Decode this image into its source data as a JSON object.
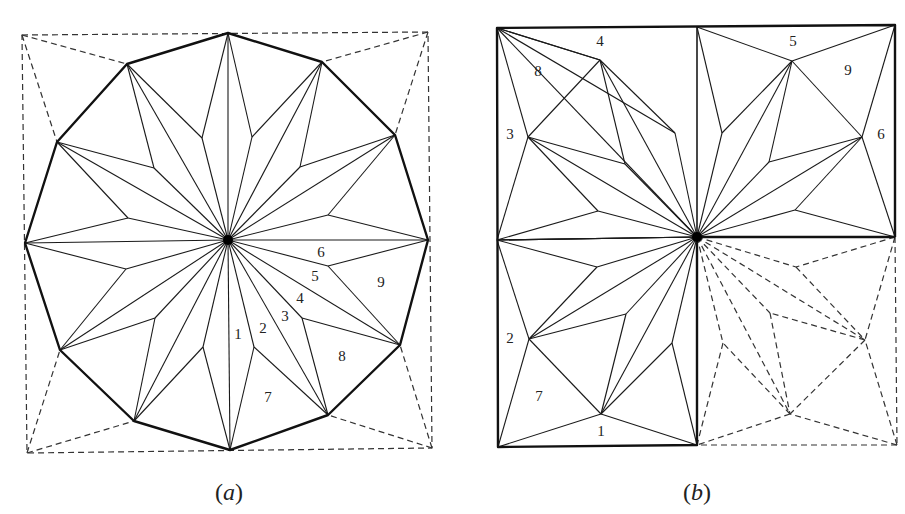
{
  "figures": [
    {
      "id": "a",
      "caption": "(a)",
      "caption_pos": [
        229,
        500
      ],
      "center": [
        228,
        240
      ],
      "dashed_square": [
        [
          22,
          35
        ],
        [
          428,
          32
        ],
        [
          432,
          448
        ],
        [
          27,
          453
        ]
      ],
      "outer_vertices": [
        [
          228,
          33
        ],
        [
          322,
          62
        ],
        [
          395,
          135
        ],
        [
          428,
          240
        ],
        [
          400,
          345
        ],
        [
          328,
          415
        ],
        [
          230,
          450
        ],
        [
          134,
          421
        ],
        [
          60,
          350
        ],
        [
          25,
          243
        ],
        [
          57,
          142
        ],
        [
          127,
          64
        ]
      ],
      "inner_points": [
        [
          252,
          137
        ],
        [
          300,
          167
        ],
        [
          328,
          215
        ],
        [
          328,
          266
        ],
        [
          302,
          318
        ],
        [
          254,
          347
        ],
        [
          203,
          347
        ],
        [
          155,
          318
        ],
        [
          126,
          269
        ],
        [
          128,
          218
        ],
        [
          154,
          168
        ],
        [
          202,
          138
        ]
      ],
      "labels": [
        {
          "text": "1",
          "x": 238,
          "y": 336
        },
        {
          "text": "2",
          "x": 263,
          "y": 330
        },
        {
          "text": "3",
          "x": 285,
          "y": 318
        },
        {
          "text": "4",
          "x": 300,
          "y": 300
        },
        {
          "text": "5",
          "x": 315,
          "y": 278
        },
        {
          "text": "6",
          "x": 321,
          "y": 254
        },
        {
          "text": "7",
          "x": 268,
          "y": 399
        },
        {
          "text": "8",
          "x": 342,
          "y": 358
        },
        {
          "text": "9",
          "x": 381,
          "y": 284
        }
      ]
    },
    {
      "id": "b",
      "caption": "(b)",
      "caption_pos": [
        697,
        500
      ],
      "center": [
        697,
        237
      ],
      "outer_rect": [
        [
          497,
          28
        ],
        [
          895,
          25
        ],
        [
          897,
          445
        ],
        [
          498,
          447
        ]
      ],
      "quadrants": [
        {
          "name": "top-left",
          "style": "solid",
          "corners": [
            [
              497,
              28
            ],
            [
              697,
              27
            ],
            [
              497,
              240
            ]
          ],
          "corner_far": [
            497,
            28
          ],
          "vertices": [
            [
              600,
              60
            ],
            [
              528,
              137
            ]
          ],
          "inner_points": [
            [
              675,
              133
            ],
            [
              625,
              164
            ],
            [
              598,
              211
            ]
          ]
        },
        {
          "name": "top-right",
          "style": "solid",
          "corners": [
            [
              697,
              27
            ],
            [
              895,
              25
            ],
            [
              895,
              237
            ]
          ],
          "corner_far": [
            895,
            25
          ],
          "vertices": [
            [
              792,
              61
            ],
            [
              862,
              137
            ]
          ],
          "inner_points": [
            [
              722,
              133
            ],
            [
              769,
              162
            ],
            [
              795,
              210
            ]
          ]
        },
        {
          "name": "bottom-left",
          "style": "solid",
          "corners": [
            [
              497,
              240
            ],
            [
              498,
              447
            ],
            [
              697,
              445
            ]
          ],
          "corner_far": [
            498,
            447
          ],
          "vertices": [
            [
              529,
              339
            ],
            [
              601,
              414
            ]
          ],
          "inner_points": [
            [
              597,
              267
            ],
            [
              626,
              314
            ],
            [
              672,
              343
            ]
          ]
        },
        {
          "name": "bottom-right",
          "style": "dashed",
          "corners": [
            [
              895,
              237
            ],
            [
              897,
              445
            ],
            [
              697,
              445
            ]
          ],
          "corner_far": [
            897,
            445
          ],
          "vertices": [
            [
              865,
              340
            ],
            [
              790,
              414
            ]
          ],
          "inner_points": [
            [
              796,
              267
            ],
            [
              770,
              313
            ],
            [
              723,
              343
            ]
          ]
        }
      ],
      "labels": [
        {
          "text": "4",
          "x": 600,
          "y": 43
        },
        {
          "text": "8",
          "x": 538,
          "y": 73
        },
        {
          "text": "3",
          "x": 510,
          "y": 136
        },
        {
          "text": "5",
          "x": 793,
          "y": 43
        },
        {
          "text": "9",
          "x": 848,
          "y": 72
        },
        {
          "text": "6",
          "x": 881,
          "y": 136
        },
        {
          "text": "2",
          "x": 510,
          "y": 340
        },
        {
          "text": "7",
          "x": 539,
          "y": 398
        },
        {
          "text": "1",
          "x": 601,
          "y": 433
        }
      ]
    }
  ]
}
